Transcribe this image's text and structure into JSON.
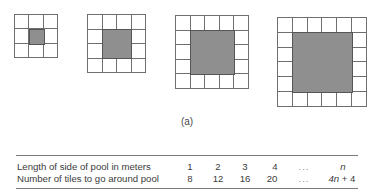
{
  "figure": {
    "caption": "(a)",
    "tile_color": "#ffffff",
    "pool_color": "#8f8f8f",
    "line_color": "#6f6f6f",
    "grids": [
      {
        "pool_side": 1,
        "grid_size": 3,
        "x": 14,
        "y": 14,
        "cell": 14.8
      },
      {
        "pool_side": 2,
        "grid_size": 4,
        "x": 87,
        "y": 14,
        "cell": 14.8
      },
      {
        "pool_side": 3,
        "grid_size": 5,
        "x": 175,
        "y": 15,
        "cell": 14.8
      },
      {
        "pool_side": 4,
        "grid_size": 6,
        "x": 277,
        "y": 17,
        "cell": 15.0
      }
    ]
  },
  "table": {
    "rows": [
      {
        "label": "Length of side of pool in meters",
        "values": [
          "1",
          "2",
          "3",
          "4",
          "...",
          "n"
        ]
      },
      {
        "label": "Number of tiles to go around pool",
        "values": [
          "8",
          "12",
          "16",
          "20",
          "...",
          "4n + 4"
        ]
      }
    ]
  }
}
